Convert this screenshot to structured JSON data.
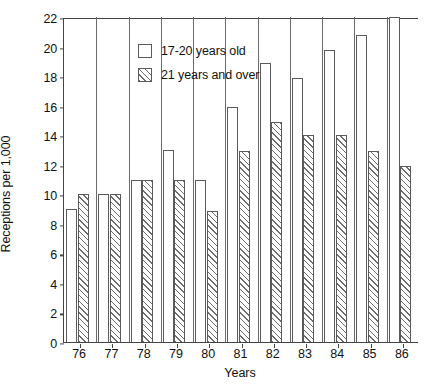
{
  "chart_data": {
    "type": "bar",
    "title": "",
    "xlabel": "Years",
    "ylabel": "Receptions per 1,000",
    "categories": [
      "76",
      "77",
      "78",
      "79",
      "80",
      "81",
      "82",
      "83",
      "84",
      "85",
      "86"
    ],
    "ylim": [
      0,
      22
    ],
    "yticks": [
      0,
      2,
      4,
      6,
      8,
      10,
      12,
      14,
      16,
      18,
      20,
      22
    ],
    "grid": false,
    "legend_position": "top-left",
    "series": [
      {
        "name": "17-20 years old",
        "style": "open",
        "values": [
          9.0,
          10.0,
          11.0,
          13.0,
          11.0,
          15.9,
          18.9,
          17.9,
          19.8,
          20.8,
          22.0
        ]
      },
      {
        "name": "21 years and over",
        "style": "hatched",
        "values": [
          10.0,
          10.0,
          11.0,
          11.0,
          8.9,
          12.9,
          14.9,
          14.0,
          14.0,
          12.9,
          11.9
        ]
      }
    ]
  },
  "axes": {
    "y_label": "Receptions per 1,000",
    "x_label": "Years",
    "y_tick_labels": [
      "0",
      "2",
      "4",
      "6",
      "8",
      "10",
      "12",
      "14",
      "16",
      "18",
      "20",
      "22"
    ],
    "x_tick_labels": [
      "76",
      "77",
      "78",
      "79",
      "80",
      "81",
      "82",
      "83",
      "84",
      "85",
      "86"
    ]
  },
  "legend": {
    "items": [
      {
        "label": "17-20 years old",
        "swatch": "open-square-icon"
      },
      {
        "label": "21 years and over",
        "swatch": "hatched-square-icon"
      }
    ]
  },
  "caption": ""
}
